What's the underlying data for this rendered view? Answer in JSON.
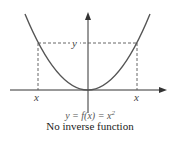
{
  "diagram": {
    "curve": "parabola y = x^2",
    "labels": {
      "y_level": "y",
      "x_left": "x",
      "x_right": "x"
    },
    "caption": {
      "equation_prefix": "y = f(x) = x",
      "equation_exponent": "2",
      "subtitle": "No inverse function"
    },
    "colors": {
      "curve": "#555555",
      "axes": "#333333",
      "dashed": "#555555"
    }
  }
}
